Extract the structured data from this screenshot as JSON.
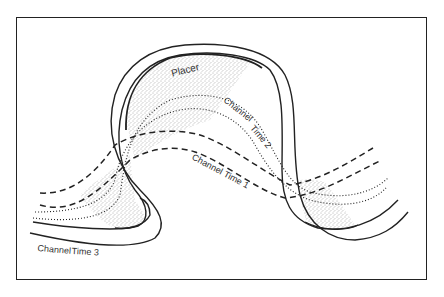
{
  "figure": {
    "labels": {
      "placer": "Placer",
      "channel_time_1": "Channel Time 1",
      "channel_time_2": "Channel Time 2",
      "channel_time_3_word1": "Channel",
      "channel_time_3_word2": "Time 3",
      "channel_time_2_word1": "Channel",
      "channel_time_2_word2": "Time 2"
    },
    "legend": {
      "time_1_style": "dashed",
      "time_2_style": "dotted",
      "time_3_style": "solid",
      "placer_style": "stippled"
    },
    "colors": {
      "line": "#222222",
      "stipple": "#555555",
      "frame": "#222222"
    }
  }
}
